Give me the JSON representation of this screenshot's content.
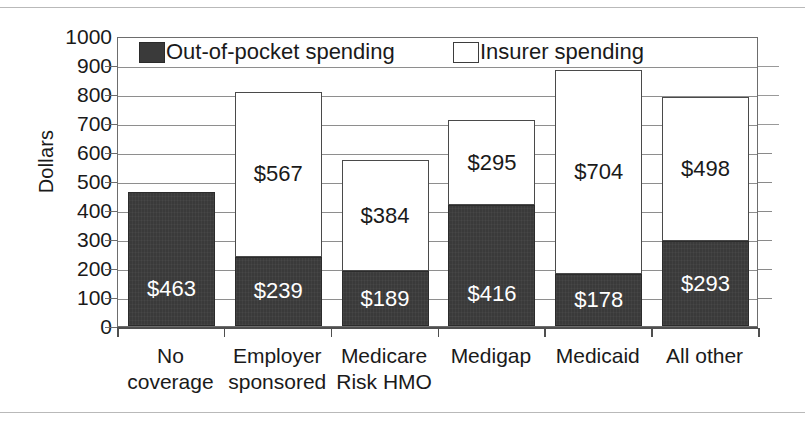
{
  "chart_data": {
    "type": "bar",
    "subtype": "stacked-vertical",
    "title": "",
    "xlabel": "",
    "ylabel": "Dollars",
    "ylim": [
      0,
      1000
    ],
    "ytick_step": 100,
    "yticks": [
      "1000",
      "900",
      "800",
      "700",
      "600",
      "500",
      "400",
      "300",
      "200",
      "100",
      "0"
    ],
    "grid": true,
    "grid_orientation": "horizontal",
    "legend_position": "top-inside",
    "categories": [
      "No coverage",
      "Employer sponsored",
      "Medicare Risk HMO",
      "Medigap",
      "Medicaid",
      "All other"
    ],
    "category_lines": [
      [
        "No",
        "coverage"
      ],
      [
        "Employer",
        "sponsored"
      ],
      [
        "Medicare",
        "Risk HMO"
      ],
      [
        "Medigap",
        ""
      ],
      [
        "Medicaid",
        ""
      ],
      [
        "All other",
        ""
      ]
    ],
    "series": [
      {
        "name": "Out-of-pocket spending",
        "color": "#3a3a3a",
        "values": [
          463,
          239,
          189,
          416,
          178,
          293
        ],
        "labels": [
          "$463",
          "$239",
          "$189",
          "$416",
          "$178",
          "$293"
        ]
      },
      {
        "name": "Insurer spending",
        "color": "#ffffff",
        "values": [
          0,
          567,
          384,
          295,
          704,
          498
        ],
        "labels": [
          "",
          "$567",
          "$384",
          "$295",
          "$704",
          "$498"
        ]
      }
    ],
    "totals": [
      463,
      806,
      573,
      711,
      882,
      791
    ]
  },
  "legend": {
    "items": [
      {
        "label": "Out-of-pocket spending",
        "swatch": "filled-dark-square"
      },
      {
        "label": "Insurer spending",
        "swatch": "open-white-square"
      }
    ]
  },
  "axis": {
    "y_title": "Dollars"
  },
  "colors": {
    "out_of_pocket": "#3a3a3a",
    "insurer": "#ffffff",
    "frame": "#6d6d6d",
    "gridline": "#8e8e8e",
    "text": "#1a1a1a"
  }
}
